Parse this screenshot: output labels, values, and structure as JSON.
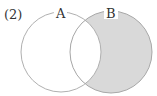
{
  "problem_label": "(2)",
  "sets": [
    {
      "name": "A",
      "cx": 61,
      "cy": 52,
      "r": 40
    },
    {
      "name": "B",
      "cx": 111,
      "cy": 52,
      "r": 41
    }
  ],
  "shaded_region": "B minus A",
  "colors": {
    "stroke": "#b0b0b0",
    "shade": "#d9d9d9",
    "background": "#ffffff"
  }
}
